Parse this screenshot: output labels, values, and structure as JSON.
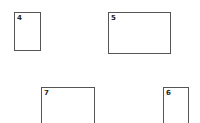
{
  "boxes": [
    {
      "id": "4",
      "label": "4"
    },
    {
      "id": "5",
      "label": "5"
    },
    {
      "id": "7",
      "label": "7"
    },
    {
      "id": "6",
      "label": "6"
    }
  ]
}
